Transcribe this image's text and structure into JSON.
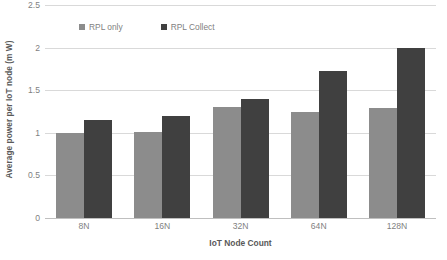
{
  "chart_data": {
    "type": "bar",
    "title": "",
    "xlabel": "IoT Node Count",
    "ylabel": "Average power per IoT node (m W)",
    "categories": [
      "8N",
      "16N",
      "32N",
      "64N",
      "128N"
    ],
    "series": [
      {
        "name": "RPL only",
        "color": "#8c8c8c",
        "values": [
          1.0,
          1.01,
          1.3,
          1.25,
          1.29
        ]
      },
      {
        "name": "RPL Collect",
        "color": "#404040",
        "values": [
          1.15,
          1.2,
          1.4,
          1.72,
          2.0
        ]
      }
    ],
    "ylim": [
      0,
      2.5
    ],
    "yticks": [
      "0",
      "0.5",
      "1",
      "1.5",
      "2",
      "2.5"
    ],
    "ytick_values": [
      0,
      0.5,
      1,
      1.5,
      2,
      2.5
    ],
    "grid": true,
    "legend_position": "top-left-inside"
  },
  "colors": {
    "series_light": "#8c8c8c",
    "series_dark": "#404040",
    "gridline": "#d9d9d9",
    "axis_line": "#bfbfbf",
    "tick_text": "#7f7f7f",
    "title_text": "#595959",
    "background": "#ffffff"
  }
}
